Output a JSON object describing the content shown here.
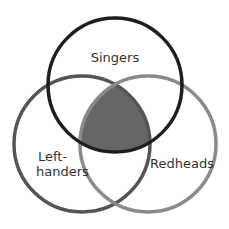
{
  "diagram": {
    "type": "venn",
    "sets": [
      {
        "id": "singers",
        "label": "Singers",
        "cx": 115,
        "cy": 85,
        "r": 67,
        "stroke": "#1e1e1e"
      },
      {
        "id": "left-handers",
        "label_line1": "Left-",
        "label_line2": "handers",
        "cx": 82,
        "cy": 144,
        "r": 68,
        "stroke": "#555555"
      },
      {
        "id": "redheads",
        "label": "Redheads",
        "cx": 148,
        "cy": 144,
        "r": 68,
        "stroke": "#8a8a8a"
      }
    ],
    "highlighted_region": {
      "description": "Intersection of Singers and Left-handers and Redheads",
      "fill": "#666666"
    }
  }
}
